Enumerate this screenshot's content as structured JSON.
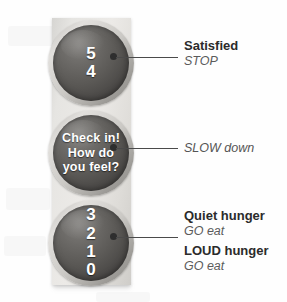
{
  "traffic_light": {
    "lamps": [
      {
        "id": "top",
        "position": "top",
        "lines": [
          "5",
          "4"
        ],
        "style": "number"
      },
      {
        "id": "middle",
        "position": "middle",
        "lines": [
          "Check in!",
          "How do",
          "you feel?"
        ],
        "style": "phrase"
      },
      {
        "id": "bottom",
        "position": "bottom",
        "lines": [
          "3",
          "2",
          "1",
          "0"
        ],
        "style": "number"
      }
    ]
  },
  "annotations": [
    {
      "id": "satisfied",
      "title": "Satisfied",
      "subtitle": "STOP",
      "target_lamp": "top"
    },
    {
      "id": "slow-down",
      "title": "",
      "subtitle": "SLOW down",
      "target_lamp": "middle"
    },
    {
      "id": "quiet-hunger",
      "title": "Quiet hunger",
      "subtitle": "GO eat",
      "target_lamp": "bottom"
    },
    {
      "id": "loud-hunger",
      "title": "LOUD hunger",
      "subtitle": "GO eat",
      "target_lamp": "bottom"
    }
  ],
  "colors": {
    "background": "#fefefe",
    "housing": "#e6e5e2",
    "lens": "#5a5855",
    "lens_text": "#ffffff",
    "annotation_title": "#2b2b2b",
    "annotation_subtitle": "#5b5b5b",
    "leader_line": "#4a4a4a"
  }
}
